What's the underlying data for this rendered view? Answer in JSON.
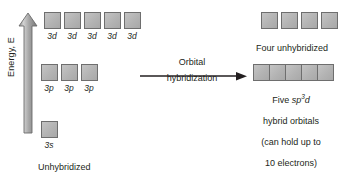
{
  "diagram": {
    "background_color": "#ffffff",
    "text_color": "#231f20",
    "box_fill_color": "#b3b3b3",
    "box_border_color": "#6e6e6e"
  },
  "energy_axis": {
    "label": "Energy, E",
    "direction": "up"
  },
  "left_side": {
    "rows": [
      {
        "name": "3d",
        "count": 5,
        "labels": [
          "3d",
          "3d",
          "3d",
          "3d",
          "3d"
        ]
      },
      {
        "name": "3p",
        "count": 3,
        "labels": [
          "3p",
          "3p",
          "3p"
        ]
      },
      {
        "name": "3s",
        "count": 1,
        "labels": [
          "3s"
        ]
      }
    ],
    "caption_line1": "Unhybridized",
    "caption_line2": "atomic orbitals"
  },
  "transition": {
    "label_line1": "Orbital",
    "label_line2": "hybridization"
  },
  "right_side": {
    "rows": [
      {
        "name": "unhybridized-3d",
        "count": 4,
        "caption_line1": "Four unhybridized",
        "caption_line2_prefix": "3d",
        "caption_line2_suffix": " orbitals"
      },
      {
        "name": "sp3d-hybrid",
        "count": 5,
        "caption_line1_prefix": "Five ",
        "caption_line1_orbital": "sp",
        "caption_line1_superscript": "3",
        "caption_line1_orbital_end": "d",
        "caption_line2": "hybrid orbitals",
        "caption_line3": "(can hold up to",
        "caption_line4": "10 electrons)"
      }
    ]
  }
}
